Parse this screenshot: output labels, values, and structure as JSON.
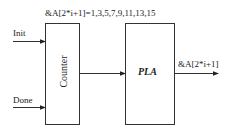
{
  "diagram": {
    "top_label": "&A[2*i+1]=1,3,5,7,9,11,13,15",
    "inputs": [
      {
        "label": "Init"
      },
      {
        "label": "Done"
      }
    ],
    "blocks": [
      {
        "label": "Counter"
      },
      {
        "label": "PLA"
      }
    ],
    "output_label": "&A[2*i+1]"
  }
}
